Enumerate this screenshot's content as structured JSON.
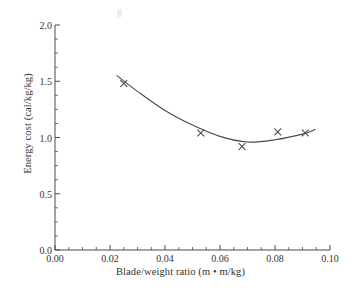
{
  "chart_data": {
    "type": "line",
    "title": "",
    "xlabel": "Blade/weight ratio (m • m/kg)",
    "ylabel": "Energy cost (cal/kg/kg)",
    "xlim": [
      0.0,
      0.1
    ],
    "ylim": [
      0.0,
      2.0
    ],
    "grid": false,
    "legend": null,
    "xticks": [
      {
        "value": 0.0,
        "label": "0.00"
      },
      {
        "value": 0.02,
        "label": "0.02"
      },
      {
        "value": 0.04,
        "label": "0.04"
      },
      {
        "value": 0.06,
        "label": "0.06"
      },
      {
        "value": 0.08,
        "label": "0.08"
      },
      {
        "value": 0.1,
        "label": "0.10"
      }
    ],
    "yticks": [
      {
        "value": 0.0,
        "label": "0.0"
      },
      {
        "value": 0.5,
        "label": "0.5"
      },
      {
        "value": 1.0,
        "label": "1.0"
      },
      {
        "value": 1.5,
        "label": "1.5"
      },
      {
        "value": 2.0,
        "label": "2.0"
      }
    ],
    "x_minor_tick_step": 0.005,
    "y_minor_tick_step": 0.125,
    "marker": "x",
    "marker_color": "#4a4a4a",
    "line_color": "#4a4a4a",
    "series": [
      {
        "name": "Energy cost",
        "x": [
          0.025,
          0.053,
          0.068,
          0.081,
          0.091
        ],
        "values": [
          1.48,
          1.04,
          0.92,
          1.05,
          1.04
        ]
      }
    ],
    "fit_curve": {
      "description": "smooth U-shaped trend line through the plotted points, extending slightly beyond the first and last markers",
      "x": [
        0.0225,
        0.03,
        0.04,
        0.05,
        0.06,
        0.07,
        0.08,
        0.09,
        0.0945
      ],
      "values": [
        1.55,
        1.41,
        1.24,
        1.11,
        1.01,
        0.96,
        0.98,
        1.03,
        1.07
      ]
    }
  },
  "axes": {
    "x_axis_name": "blade-weight-ratio-axis",
    "y_axis_name": "energy-cost-axis"
  }
}
